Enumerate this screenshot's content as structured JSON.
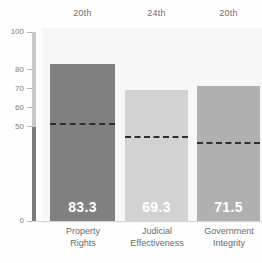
{
  "chart_data": {
    "type": "bar",
    "title": "",
    "xlabel": "",
    "ylabel": "",
    "ylim": [
      0,
      100
    ],
    "grid": false,
    "legend": "none",
    "categories": [
      "Property\nRights",
      "Judicial\nEffectiveness",
      "Government\nIntegrity"
    ],
    "values": [
      83.3,
      69.3,
      71.5
    ],
    "value_labels": [
      "83.3",
      "69.3",
      "71.5"
    ],
    "rank_labels": [
      "20th",
      "24th",
      "20th"
    ],
    "reference_lines": [
      52.0,
      45.0,
      42.0
    ],
    "ytick_labels": [
      "100",
      "80",
      "70",
      "60",
      "50",
      "0"
    ],
    "ytick_values": [
      100,
      80,
      70,
      60,
      50,
      0
    ],
    "bar_colors": [
      "#808080",
      "#d2d2d2",
      "#b0b0b0"
    ],
    "reference_line_color": "#2f2f2f",
    "value_label_color": "#ffffff",
    "axis_text_color": "#808080",
    "band_color": "#f7f7f7"
  }
}
